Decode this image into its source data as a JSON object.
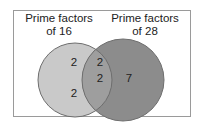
{
  "diagram": {
    "type": "venn",
    "sets": [
      {
        "label_line1": "Prime factors",
        "label_line2": "of 16",
        "color": "#c9c9c9"
      },
      {
        "label_line1": "Prime factors",
        "label_line2": "of 28",
        "color": "#8c8c8c"
      }
    ],
    "regions": {
      "left_only": [
        "2",
        "2"
      ],
      "intersection": [
        "2",
        "2"
      ],
      "right_only": [
        "7"
      ]
    },
    "intersection_color": "#a6a6a6",
    "outline_color": "#6e6e6e"
  }
}
